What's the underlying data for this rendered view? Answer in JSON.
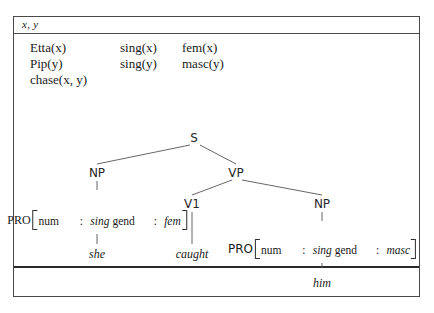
{
  "diagram": {
    "type": "drs-with-syntax-tree",
    "universe": {
      "referents": "x, y"
    },
    "conditions": [
      {
        "col1": "Etta(x)",
        "col2": "sing(x)",
        "col3": "fem(x)"
      },
      {
        "col1": "Pip(y)",
        "col2": "sing(y)",
        "col3": "masc(y)"
      },
      {
        "col1": "chase(x, y)",
        "col2": "",
        "col3": ""
      }
    ],
    "tree": {
      "nodes": [
        {
          "id": "s",
          "label": "S",
          "x": 180,
          "y": 97
        },
        {
          "id": "np1",
          "label": "NP",
          "x": 83,
          "y": 132
        },
        {
          "id": "vp",
          "label": "VP",
          "x": 222,
          "y": 132
        },
        {
          "id": "v1",
          "label": "V1",
          "x": 178,
          "y": 163
        },
        {
          "id": "np2",
          "label": "NP",
          "x": 308,
          "y": 163
        }
      ],
      "avms": [
        {
          "id": "avm-left",
          "head": "PRO",
          "head_style": "serif",
          "x": 83,
          "y": 176,
          "rows": [
            {
              "attr": "num",
              "sep": ":",
              "value": "sing"
            },
            {
              "attr": "gend",
              "sep": ":",
              "value": "fem"
            }
          ]
        },
        {
          "id": "avm-right",
          "head": "PRO",
          "head_style": "sans",
          "x": 308,
          "y": 205,
          "rows": [
            {
              "attr": "num",
              "sep": ":",
              "value": "sing"
            },
            {
              "attr": "gend",
              "sep": ":",
              "value": "masc"
            }
          ]
        }
      ],
      "leaves": [
        {
          "id": "leaf-she",
          "label": "she",
          "x": 83,
          "y": 213
        },
        {
          "id": "leaf-caught",
          "label": "caught",
          "x": 178,
          "y": 213
        },
        {
          "id": "leaf-him",
          "label": "him",
          "x": 308,
          "y": 242
        }
      ]
    },
    "colors": {
      "border": "#4a4a4a",
      "divider": "#2b2b2b",
      "edge": "#555555",
      "text": "#1a1a1a",
      "background": "#ffffff"
    }
  }
}
